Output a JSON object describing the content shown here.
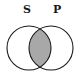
{
  "diagram": {
    "type": "venn",
    "sets": [
      {
        "name": "S",
        "label": "S"
      },
      {
        "name": "P",
        "label": "P"
      }
    ],
    "shaded_regions": [
      "S∩P"
    ],
    "colors": {
      "stroke": "#1a1a1a",
      "shade": "#a8a8a8",
      "background": "#ffffff"
    }
  }
}
